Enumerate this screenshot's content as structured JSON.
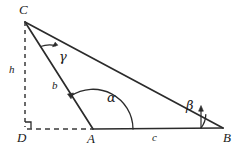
{
  "figure": {
    "kind": "triangle-with-altitude-diagram",
    "background_color": "#ffffff",
    "stroke_color": "#2b2b2b",
    "label_color": "#1a1a1a"
  },
  "vertices": [
    {
      "id": "C",
      "label": "C",
      "x": 25,
      "y": 22,
      "label_x": 19,
      "label_y": 3
    },
    {
      "id": "D",
      "label": "D",
      "x": 25,
      "y": 129,
      "label_x": 17,
      "label_y": 131
    },
    {
      "id": "A",
      "label": "A",
      "x": 93,
      "y": 129,
      "label_x": 87,
      "label_y": 132
    },
    {
      "id": "B",
      "label": "B",
      "x": 223,
      "y": 128,
      "label_x": 223,
      "label_y": 131
    }
  ],
  "segments": [
    {
      "id": "CB",
      "label": "",
      "style": "solid",
      "from": "C",
      "to": "B"
    },
    {
      "id": "CA",
      "label": "b",
      "style": "solid",
      "from": "C",
      "to": "A",
      "label_x": 52,
      "label_y": 80
    },
    {
      "id": "AB",
      "label": "c",
      "style": "solid",
      "from": "A",
      "to": "B",
      "label_x": 152,
      "label_y": 132
    },
    {
      "id": "CD",
      "label": "h",
      "style": "dashed",
      "from": "C",
      "to": "D",
      "label_x": 9,
      "label_y": 64
    },
    {
      "id": "DA",
      "label": "",
      "style": "dashed",
      "from": "D",
      "to": "A"
    }
  ],
  "angles": [
    {
      "id": "gamma",
      "label": "γ",
      "at": "C",
      "label_x": 59,
      "label_y": 50,
      "arrow": "to-CB"
    },
    {
      "id": "alpha",
      "label": "α",
      "at": "A",
      "label_x": 107,
      "label_y": 91,
      "arrow": "to-AC"
    },
    {
      "id": "beta",
      "label": "β",
      "at": "B",
      "label_x": 186,
      "label_y": 99,
      "arrow": "to-BC"
    }
  ],
  "markers": [
    {
      "id": "right-angle-D",
      "at": "D",
      "label": "",
      "size": 6
    }
  ]
}
